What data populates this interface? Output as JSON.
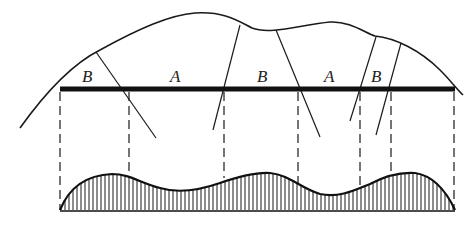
{
  "diagram": {
    "colors": {
      "stroke": "#1a1a1a",
      "background": "#ffffff"
    },
    "labels": [
      {
        "text": "B",
        "x": 82,
        "y": 82
      },
      {
        "text": "A",
        "x": 170,
        "y": 82
      },
      {
        "text": "B",
        "x": 257,
        "y": 82
      },
      {
        "text": "A",
        "x": 324,
        "y": 82
      },
      {
        "text": "B",
        "x": 371,
        "y": 82
      }
    ],
    "bar": {
      "x1": 60,
      "x2": 455,
      "y": 89
    },
    "dashed_verticals_x": [
      60,
      129,
      224,
      298,
      360,
      391,
      454
    ],
    "baseline_y": 211
  }
}
